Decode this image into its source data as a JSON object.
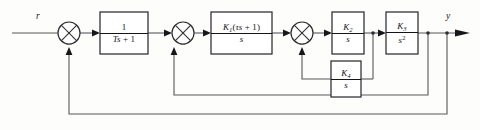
{
  "diagram": {
    "type": "control-system-block-diagram",
    "signals": {
      "input_label": "r",
      "output_label": "y"
    },
    "blocks": [
      {
        "id": "lag-filter",
        "name": "first-order-lag-block",
        "numerator": "1",
        "denominator": "Ts + 1",
        "expression": "1/(Ts+1)"
      },
      {
        "id": "pi-lead",
        "name": "pi-lead-controller-block",
        "numerator": "K1(τs + 1)",
        "denominator": "s",
        "expression": "K1(τs+1)/s"
      },
      {
        "id": "integrator-k2",
        "name": "integrator-k2-block",
        "numerator": "K2",
        "denominator": "s",
        "expression": "K2/s"
      },
      {
        "id": "double-integrator-k3",
        "name": "double-integrator-k3-block",
        "numerator": "K3",
        "denominator": "s²",
        "expression": "K3/s^2"
      },
      {
        "id": "feedback-k4",
        "name": "feedback-integrator-k4-block",
        "numerator": "K4",
        "denominator": "s",
        "expression": "K4/s"
      }
    ],
    "summing_junctions": [
      {
        "id": "sum-1",
        "name": "summing-junction-outer",
        "bottom_sign": "−"
      },
      {
        "id": "sum-2",
        "name": "summing-junction-middle",
        "bottom_sign": "−"
      },
      {
        "id": "sum-3",
        "name": "summing-junction-inner",
        "bottom_sign": "−"
      }
    ],
    "feedback_loops": [
      {
        "id": "loop-inner",
        "name": "inner-feedback-loop",
        "from": "after-integrator-k2",
        "through": "feedback-k4",
        "to": "sum-3"
      },
      {
        "id": "loop-middle",
        "name": "middle-feedback-loop",
        "from": "after-double-integrator-k3",
        "through": "direct",
        "to": "sum-2"
      },
      {
        "id": "loop-outer",
        "name": "outer-feedback-loop",
        "from": "output-y",
        "through": "direct",
        "to": "sum-1"
      }
    ],
    "colors": {
      "wire": "#58585a",
      "block_border": "#2e2e30",
      "text": "#16161a",
      "background": "#fdfdfb"
    }
  }
}
